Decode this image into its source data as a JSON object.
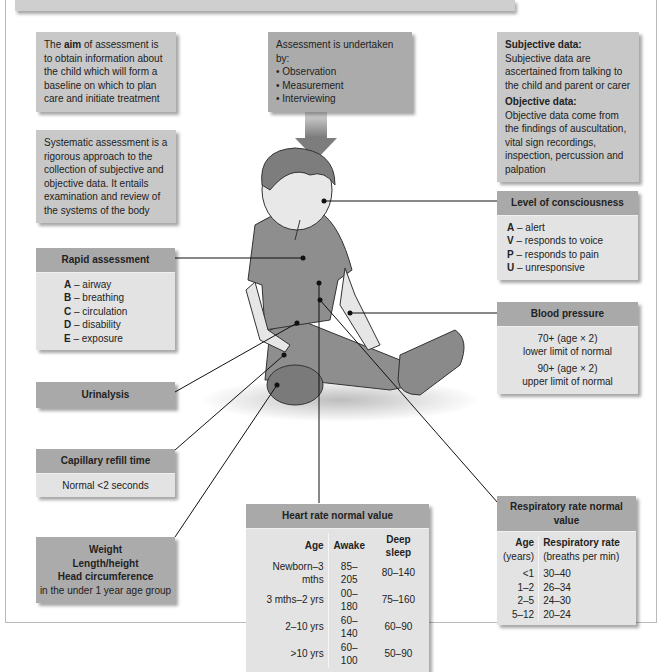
{
  "aim_box": {
    "prefix": "The ",
    "bold": "aim",
    "suffix": " of assessment is to obtain information about the child which will form a baseline on which to plan care and initiate treatment"
  },
  "systematic_box": {
    "text": "Systematic assessment is a rigorous approach to the collection of subjective and objective data. It entails examination and review of the systems of the body"
  },
  "undertaken_box": {
    "title": "Assessment is undertaken by:",
    "items": [
      "• Observation",
      "• Measurement",
      "• Interviewing"
    ]
  },
  "data_box": {
    "subjective_title": "Subjective data:",
    "subjective_text": "Subjective data are ascertained from talking to the child and parent or carer",
    "objective_title": "Objective data:",
    "objective_text": "Objective data come from the findings of auscultation, vital sign recordings, inspection, percussion and palpation"
  },
  "consciousness": {
    "title": "Level of consciousness",
    "items": [
      {
        "key": "A",
        "text": " – alert"
      },
      {
        "key": "V",
        "text": " – responds to voice"
      },
      {
        "key": "P",
        "text": " – responds to pain"
      },
      {
        "key": "U",
        "text": " – unresponsive"
      }
    ]
  },
  "rapid": {
    "title": "Rapid assessment",
    "items": [
      {
        "key": "A",
        "text": " – airway"
      },
      {
        "key": "B",
        "text": " – breathing"
      },
      {
        "key": "C",
        "text": " – circulation"
      },
      {
        "key": "D",
        "text": " – disability"
      },
      {
        "key": "E",
        "text": " – exposure"
      }
    ]
  },
  "blood_pressure": {
    "title": "Blood pressure",
    "line1": "70+ (age × 2)",
    "line2": "lower limit of normal",
    "line3": "90+ (age × 2)",
    "line4": "upper limit of normal"
  },
  "urinalysis": {
    "title": "Urinalysis"
  },
  "capillary": {
    "title": "Capillary refill time",
    "text": "Normal <2 seconds"
  },
  "growth": {
    "line1": "Weight",
    "line2": "Length/height",
    "line3": "Head circumference",
    "line4": "in the under 1 year age group"
  },
  "heart_rate": {
    "title": "Heart rate normal value",
    "headers": [
      "Age",
      "Awake",
      "Deep sleep"
    ],
    "rows": [
      [
        "Newborn–3 mths",
        "85–205",
        "80–140"
      ],
      [
        "3 mths–2 yrs",
        "00–180",
        "75–160"
      ],
      [
        "2–10 yrs",
        "60–140",
        "60–90"
      ],
      [
        ">10 yrs",
        "60–100",
        "50–90"
      ]
    ]
  },
  "respiratory": {
    "title": "Respiratory rate normal value",
    "headers": [
      "Age",
      "Respiratory rate"
    ],
    "subheaders": [
      "(years)",
      "(breaths per min)"
    ],
    "rows": [
      [
        "<1",
        "30–40"
      ],
      [
        "1–2",
        "26–34"
      ],
      [
        "2–5",
        "24–30"
      ],
      [
        "5–12",
        "20–24"
      ]
    ]
  },
  "icons": {
    "arrow": "down-arrow-icon",
    "figure": "child-illustration"
  }
}
